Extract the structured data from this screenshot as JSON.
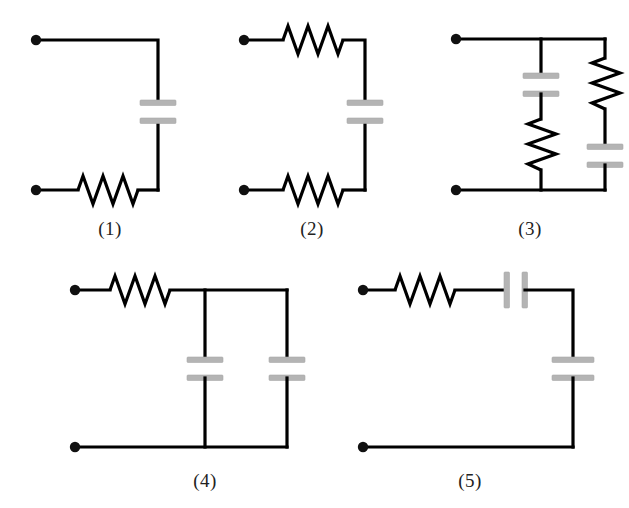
{
  "figure": {
    "background_color": "#ffffff",
    "wire_color": "#000000",
    "plate_color": "#b4b4b4",
    "terminal_color": "#111111"
  },
  "circuits": [
    {
      "id": "circuit-1",
      "label": "(1)",
      "label_x": 110,
      "label_y": 218,
      "components": [
        {
          "kind": "terminal",
          "name": "input-terminal",
          "x": 35,
          "y": 40
        },
        {
          "kind": "terminal",
          "name": "output-terminal",
          "x": 35,
          "y": 190
        },
        {
          "kind": "capacitor",
          "name": "capacitor",
          "orientation": "horizontal-plates",
          "x": 158,
          "y": 112
        },
        {
          "kind": "resistor",
          "name": "resistor",
          "orientation": "horizontal",
          "x": 108,
          "y": 190
        }
      ]
    },
    {
      "id": "circuit-2",
      "label": "(2)",
      "label_x": 312,
      "label_y": 218,
      "components": [
        {
          "kind": "terminal",
          "name": "input-terminal",
          "x": 243,
          "y": 40
        },
        {
          "kind": "terminal",
          "name": "output-terminal",
          "x": 243,
          "y": 190
        },
        {
          "kind": "resistor",
          "name": "top-resistor",
          "orientation": "horizontal",
          "x": 312,
          "y": 40
        },
        {
          "kind": "capacitor",
          "name": "capacitor",
          "orientation": "horizontal-plates",
          "x": 365,
          "y": 112
        },
        {
          "kind": "resistor",
          "name": "bottom-resistor",
          "orientation": "horizontal",
          "x": 312,
          "y": 190
        }
      ]
    },
    {
      "id": "circuit-3",
      "label": "(3)",
      "label_x": 530,
      "label_y": 218,
      "components": [
        {
          "kind": "terminal",
          "name": "input-terminal",
          "x": 455,
          "y": 39
        },
        {
          "kind": "terminal",
          "name": "output-terminal",
          "x": 455,
          "y": 190
        },
        {
          "kind": "capacitor",
          "name": "left-branch-capacitor",
          "orientation": "horizontal-plates",
          "x": 541,
          "y": 87
        },
        {
          "kind": "resistor",
          "name": "left-branch-resistor",
          "orientation": "vertical",
          "x": 541,
          "y": 145
        },
        {
          "kind": "resistor",
          "name": "right-branch-resistor",
          "orientation": "vertical",
          "x": 605,
          "y": 84
        },
        {
          "kind": "capacitor",
          "name": "right-branch-capacitor",
          "orientation": "horizontal-plates",
          "x": 605,
          "y": 155
        }
      ]
    },
    {
      "id": "circuit-4",
      "label": "(4)",
      "label_x": 205,
      "label_y": 470,
      "components": [
        {
          "kind": "terminal",
          "name": "input-terminal",
          "x": 74,
          "y": 290
        },
        {
          "kind": "terminal",
          "name": "output-terminal",
          "x": 74,
          "y": 447
        },
        {
          "kind": "resistor",
          "name": "series-resistor",
          "orientation": "horizontal",
          "x": 137,
          "y": 290
        },
        {
          "kind": "capacitor",
          "name": "first-shunt-capacitor",
          "orientation": "horizontal-plates",
          "x": 205,
          "y": 369
        },
        {
          "kind": "capacitor",
          "name": "second-shunt-capacitor",
          "orientation": "horizontal-plates",
          "x": 287,
          "y": 369
        }
      ]
    },
    {
      "id": "circuit-5",
      "label": "(5)",
      "label_x": 470,
      "label_y": 470,
      "components": [
        {
          "kind": "terminal",
          "name": "input-terminal",
          "x": 362,
          "y": 290
        },
        {
          "kind": "terminal",
          "name": "output-terminal",
          "x": 362,
          "y": 447
        },
        {
          "kind": "resistor",
          "name": "series-resistor",
          "orientation": "horizontal",
          "x": 422,
          "y": 290
        },
        {
          "kind": "capacitor",
          "name": "series-capacitor",
          "orientation": "vertical-plates",
          "x": 514,
          "y": 290
        },
        {
          "kind": "capacitor",
          "name": "shunt-capacitor",
          "orientation": "horizontal-plates",
          "x": 573,
          "y": 369
        }
      ]
    }
  ]
}
